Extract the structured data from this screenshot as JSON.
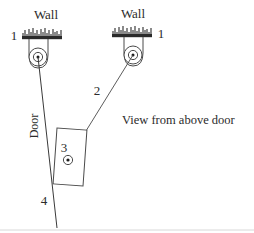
{
  "figure": {
    "caption": "View from above door",
    "background_color": "#ffffff",
    "line_color": "#3a3a3a",
    "wall_color": "#2a2a2a",
    "text_color": "#2b2b2b"
  },
  "labels": {
    "wall_left": "Wall",
    "wall_right": "Wall",
    "hinge_left_number": "1",
    "hinge_right_number": "1",
    "rope_number": "2",
    "panel_number": "3",
    "door_edge_number": "4",
    "door_text": "Door"
  },
  "diagram_data": {
    "type": "schematic",
    "title": "View from above door",
    "description": "Top view of a door with two wall-mounted hinge assemblies and a connecting member",
    "components": [
      {
        "id": "1",
        "name": "hinge-left",
        "kind": "wall-mounted pivot",
        "center": [
          38,
          57
        ],
        "wall_attachment": [
          41,
          35
        ]
      },
      {
        "id": "1",
        "name": "hinge-right",
        "kind": "wall-mounted pivot",
        "center": [
          133,
          55
        ],
        "wall_attachment": [
          131,
          33
        ]
      },
      {
        "id": "2",
        "name": "link-member",
        "kind": "line",
        "from": [
          133,
          55
        ],
        "to": [
          68,
          160
        ]
      },
      {
        "id": "3",
        "name": "panel-block",
        "kind": "rectangle",
        "center": [
          70,
          157
        ],
        "width": 30,
        "height": 56,
        "rotation_deg": 4,
        "pivot": [
          68,
          160
        ]
      },
      {
        "id": "4",
        "name": "door-edge",
        "kind": "line",
        "from": [
          38,
          57
        ],
        "to": [
          57,
          228
        ]
      }
    ],
    "walls": [
      {
        "name": "wall-left",
        "x": 22,
        "y": 34,
        "width": 40,
        "hatched": true
      },
      {
        "name": "wall-right",
        "x": 112,
        "y": 32,
        "width": 40,
        "hatched": true
      }
    ]
  }
}
